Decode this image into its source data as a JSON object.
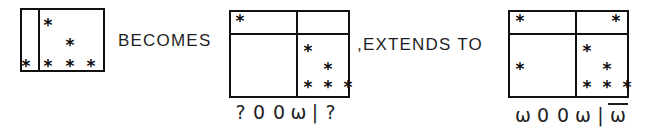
{
  "figure": {
    "kind": "hand-drawn combinatorial grid diagram",
    "mark_glyph": "*",
    "line_color": "#111111",
    "text_color": "#1f1f1f",
    "background": "#ffffff"
  },
  "connectors": [
    {
      "id": "becomes",
      "text": "BECOMES",
      "x": 118,
      "y": 31
    },
    {
      "id": "extends-to",
      "text": ",EXTENDS TO",
      "x": 357,
      "y": 35
    }
  ],
  "panels": [
    {
      "id": "panel-left",
      "label": "left-diagram",
      "box": {
        "x": 20,
        "y": 8,
        "w": 85,
        "h": 64
      },
      "dividers": {
        "vertical": [
          18
        ],
        "horizontal": []
      },
      "marks": [
        {
          "x": 28,
          "y": 17
        },
        {
          "x": 50,
          "y": 37
        },
        {
          "x": 6,
          "y": 58
        },
        {
          "x": 28,
          "y": 58
        },
        {
          "x": 50,
          "y": 58
        },
        {
          "x": 71,
          "y": 58
        }
      ],
      "caption": null
    },
    {
      "id": "panel-middle",
      "box": {
        "x": 229,
        "y": 10,
        "w": 121,
        "h": 88
      },
      "label": "middle-diagram",
      "dividers": {
        "vertical": [
          67
        ],
        "horizontal": [
          23
        ]
      },
      "marks": [
        {
          "x": 11,
          "y": 11
        },
        {
          "x": 79,
          "y": 41
        },
        {
          "x": 99,
          "y": 59
        },
        {
          "x": 79,
          "y": 77
        },
        {
          "x": 99,
          "y": 77
        },
        {
          "x": 119,
          "y": 77
        }
      ],
      "caption": {
        "id": "caption-middle",
        "x": 232,
        "y": 103,
        "symbols": [
          {
            "text": "?",
            "overbar": false,
            "w": 17
          },
          {
            "text": "0",
            "overbar": false,
            "w": 20
          },
          {
            "text": "0",
            "overbar": false,
            "w": 20
          },
          {
            "text": "ω",
            "overbar": false,
            "w": 19
          },
          {
            "text": "|",
            "overbar": false,
            "w": 14
          },
          {
            "text": "?",
            "overbar": false,
            "w": 17
          }
        ]
      }
    },
    {
      "id": "panel-right",
      "box": {
        "x": 508,
        "y": 10,
        "w": 121,
        "h": 88
      },
      "label": "right-diagram",
      "dividers": {
        "vertical": [
          67
        ],
        "horizontal": [
          23
        ]
      },
      "marks": [
        {
          "x": 12,
          "y": 11
        },
        {
          "x": 108,
          "y": 11
        },
        {
          "x": 79,
          "y": 41
        },
        {
          "x": 12,
          "y": 59
        },
        {
          "x": 99,
          "y": 59
        },
        {
          "x": 79,
          "y": 77
        },
        {
          "x": 99,
          "y": 77
        },
        {
          "x": 119,
          "y": 77
        }
      ],
      "caption": {
        "id": "caption-right",
        "x": 513,
        "y": 103,
        "symbols": [
          {
            "text": "ω",
            "overbar": false,
            "w": 20
          },
          {
            "text": "0",
            "overbar": false,
            "w": 20
          },
          {
            "text": "0",
            "overbar": false,
            "w": 20
          },
          {
            "text": "ω",
            "overbar": false,
            "w": 20
          },
          {
            "text": "|",
            "overbar": false,
            "w": 15
          },
          {
            "text": "ω",
            "overbar": true,
            "w": 20
          }
        ]
      }
    }
  ]
}
